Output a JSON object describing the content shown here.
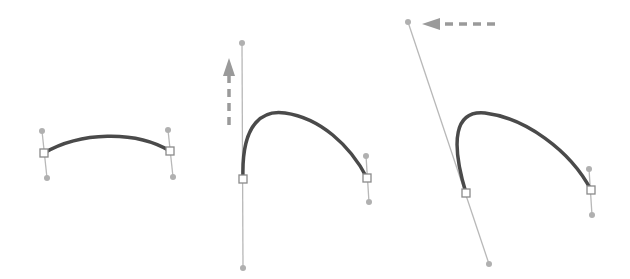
{
  "diagram": {
    "colors": {
      "curve": "#4a4a4a",
      "handle_line": "#b8b8b8",
      "handle_dot": "#b0b0b0",
      "anchor_stroke": "#8a8a8a",
      "arrow": "#9a9a9a"
    },
    "panels": [
      {
        "id": "panel-1",
        "curve": "M44,153 C80,132 135,130 170,151",
        "anchors": [
          {
            "x": 44,
            "y": 153
          },
          {
            "x": 170,
            "y": 151
          }
        ],
        "handles": [
          {
            "from": {
              "x": 42,
              "y": 131
            },
            "to": {
              "x": 47,
              "y": 178
            }
          },
          {
            "from": {
              "x": 168,
              "y": 130
            },
            "to": {
              "x": 173,
              "y": 177
            }
          }
        ],
        "arrow": null
      },
      {
        "id": "panel-2",
        "curve": "M243,179 C241,120 265,110 285,113 C320,118 350,145 367,178",
        "anchors": [
          {
            "x": 243,
            "y": 179
          },
          {
            "x": 367,
            "y": 178
          }
        ],
        "handles": [
          {
            "from": {
              "x": 242,
              "y": 43
            },
            "to": {
              "x": 243,
              "y": 268
            }
          },
          {
            "from": {
              "x": 366,
              "y": 156
            },
            "to": {
              "x": 369,
              "y": 202
            }
          }
        ],
        "arrow": {
          "direction": "up",
          "x": 229,
          "y1": 125,
          "y2": 62
        }
      },
      {
        "id": "panel-3",
        "curve": "M466,193 C450,140 455,110 485,113 C525,118 570,150 591,190",
        "anchors": [
          {
            "x": 466,
            "y": 193
          },
          {
            "x": 591,
            "y": 190
          }
        ],
        "handles": [
          {
            "from": {
              "x": 408,
              "y": 22
            },
            "to": {
              "x": 489,
              "y": 264
            }
          },
          {
            "from": {
              "x": 589,
              "y": 169
            },
            "to": {
              "x": 592,
              "y": 215
            }
          }
        ],
        "arrow": {
          "direction": "left",
          "y": 24,
          "x1": 495,
          "x2": 422
        }
      }
    ]
  }
}
